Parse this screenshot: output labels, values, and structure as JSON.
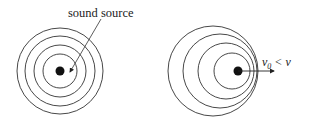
{
  "diagram": {
    "left": {
      "label": "sound source",
      "center": [
        60,
        71
      ],
      "radii": [
        43,
        35,
        26,
        17
      ],
      "source_dot_radius": 4.5
    },
    "right": {
      "label_v": "v",
      "label_sub": "0",
      "label_rest": " < v",
      "source": [
        238,
        71
      ],
      "circles": [
        {
          "cx": 213,
          "cy": 71,
          "r": 45
        },
        {
          "cx": 220,
          "cy": 71,
          "r": 37
        },
        {
          "cx": 226,
          "cy": 71,
          "r": 28
        },
        {
          "cx": 232,
          "cy": 71,
          "r": 18
        }
      ],
      "arrow_end": [
        274,
        71
      ]
    },
    "colors": {
      "stroke": "#333333",
      "dot": "#111111"
    }
  }
}
